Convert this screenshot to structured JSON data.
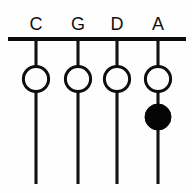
{
  "diagram": {
    "kind": "string-instrument-fingering-chart",
    "title": "",
    "background_color": "#fefefe",
    "ink_color": "#0d0d0d",
    "canvas": {
      "width": 192,
      "height": 193
    },
    "nut": {
      "label": "nut",
      "x1": 8,
      "x2": 186,
      "y": 39,
      "thickness": 4.2,
      "color": "#0c0c0c"
    },
    "strings": [
      {
        "label": "C",
        "x": 36,
        "y_top": 39,
        "y_bottom": 184,
        "label_y": 30,
        "notes": [
          {
            "type": "open",
            "cx": 36,
            "cy": 79,
            "r": 12.6,
            "fill": "#fdfdfd",
            "stroke": "#0d0d0d"
          }
        ]
      },
      {
        "label": "G",
        "x": 78,
        "y_top": 39,
        "y_bottom": 184,
        "label_y": 30,
        "notes": [
          {
            "type": "open",
            "cx": 78,
            "cy": 79,
            "r": 12.6,
            "fill": "#fdfdfd",
            "stroke": "#0d0d0d"
          }
        ]
      },
      {
        "label": "D",
        "x": 117,
        "y_top": 39,
        "y_bottom": 184,
        "label_y": 30,
        "notes": [
          {
            "type": "open",
            "cx": 117,
            "cy": 79,
            "r": 12.6,
            "fill": "#fdfdfd",
            "stroke": "#0d0d0d"
          }
        ]
      },
      {
        "label": "A",
        "x": 158,
        "y_top": 39,
        "y_bottom": 184,
        "label_y": 30,
        "notes": [
          {
            "type": "open",
            "cx": 158,
            "cy": 79,
            "r": 12.6,
            "fill": "#fdfdfd",
            "stroke": "#0d0d0d"
          },
          {
            "type": "filled",
            "cx": 158,
            "cy": 117,
            "r": 13.0,
            "fill": "#050505",
            "stroke": "#050505"
          }
        ]
      }
    ],
    "legend": {
      "open_note_meaning": "open circle",
      "filled_note_meaning": "filled circle"
    }
  }
}
